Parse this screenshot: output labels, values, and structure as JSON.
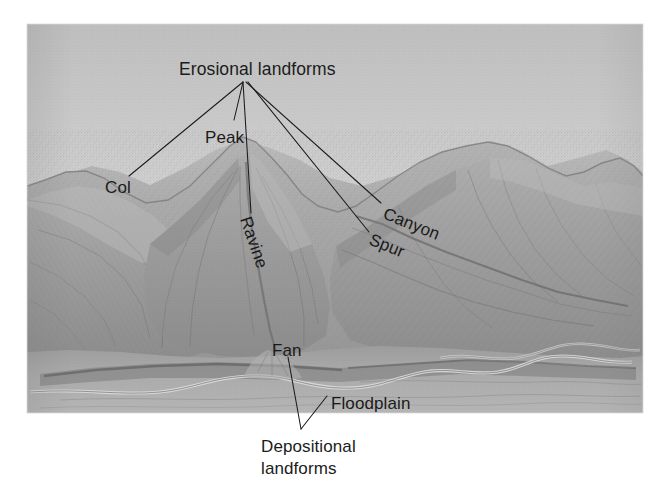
{
  "figure": {
    "type": "illustration-diagram",
    "frame": {
      "x": 27,
      "y": 24,
      "width": 616,
      "height": 389
    },
    "background_color": "#ffffff",
    "sky_color_top": "#c4c4c4",
    "sky_color_bottom": "#e9e9e9",
    "terrain_color": "#a9a9a9",
    "terrain_shadow_color": "#7e7e7e",
    "label_color": "#1b1b1b"
  },
  "labels": {
    "erosional_group": "Erosional landforms",
    "col": "Col",
    "peak": "Peak",
    "ravine": "Ravine",
    "canyon": "Canyon",
    "spur": "Spur",
    "fan": "Fan",
    "floodplain": "Floodplain",
    "depositional_line1": "Depositional",
    "depositional_line2": "landforms"
  },
  "annotation_groups": [
    {
      "name": "erosional-landforms",
      "title": "Erosional landforms",
      "members": [
        "Col",
        "Peak",
        "Ravine",
        "Canyon",
        "Spur"
      ]
    },
    {
      "name": "depositional-landforms",
      "title": "Depositional landforms",
      "members": [
        "Fan",
        "Floodplain"
      ]
    }
  ]
}
